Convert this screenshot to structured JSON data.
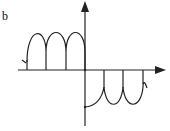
{
  "figure": {
    "panel_label": "b",
    "colors": {
      "stroke": "#222222",
      "background": "#ffffff"
    }
  }
}
